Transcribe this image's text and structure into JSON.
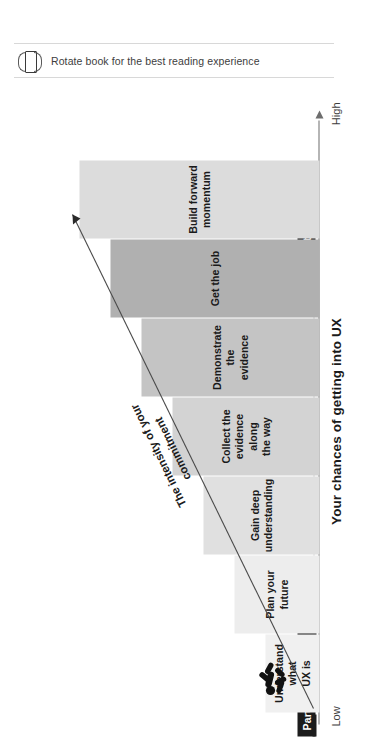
{
  "banner": {
    "icon": "rotate-book-icon",
    "text": "Rotate book for the best reading experience"
  },
  "chart_data": {
    "type": "bar",
    "title": "Your chances of getting into UX",
    "xlabel": "",
    "ylabel": "Your chances of getting into UX",
    "axis_low_label": "Low",
    "axis_high_label": "High",
    "grid": false,
    "orientation": "rotated-90",
    "annotation": {
      "line1": "The intensity of your",
      "line2": "commitment"
    },
    "categories": [
      "Understand what UX is",
      "Plan your future",
      "Gain deep understanding",
      "Collect the evidence along the way",
      "Demonstrate the evidence",
      "Get the job",
      "Build forward momentum"
    ],
    "values": [
      1,
      2,
      3,
      4,
      5,
      6,
      7
    ],
    "steps": [
      {
        "label": "Understand what UX is",
        "lines": [
          "Understand what",
          "UX is"
        ],
        "color": "#f0f0f0",
        "part": "Part I"
      },
      {
        "label": "Plan your future",
        "lines": [
          "Plan your future"
        ],
        "color": "#ededed",
        "part": "Part II"
      },
      {
        "label": "Gain deep understanding",
        "lines": [
          "Gain deep",
          "understanding"
        ],
        "color": "#e0e0e0",
        "part": "Part III"
      },
      {
        "label": "Collect the evidence along the way",
        "lines": [
          "Collect the",
          "evidence along",
          "the way"
        ],
        "color": "#d3d3d3",
        "part": "Part III"
      },
      {
        "label": "Demonstrate the evidence",
        "lines": [
          "Demonstrate the",
          "evidence"
        ],
        "color": "#c4c4c4",
        "part": "Part III"
      },
      {
        "label": "Get the job",
        "lines": [
          "Get the job"
        ],
        "color": "#b0b0b0",
        "part": "Part III"
      },
      {
        "label": "Build forward momentum",
        "lines": [
          "Build forward",
          "momentum"
        ],
        "color": "#dcdcdc",
        "part": "Part IV (bonus)"
      }
    ],
    "parts": [
      {
        "label": "Part I"
      },
      {
        "label": "Part II"
      },
      {
        "label": "Part III"
      },
      {
        "label": "Part IV (bonus)"
      }
    ],
    "colors": {
      "axis": "#6d6d6d",
      "badge_bg": "#1c1c1c",
      "badge_text": "#ffffff",
      "text": "#1a1a1a",
      "trend_line": "#4a4a4a"
    },
    "figure_icon": "falling-person-icon"
  }
}
